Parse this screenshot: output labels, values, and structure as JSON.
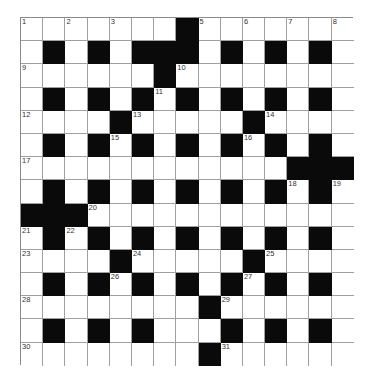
{
  "puzzle": {
    "rows": 15,
    "cols": 15,
    "colors": {
      "block": "#0a0a0a",
      "cell": "#ffffff",
      "line": "#a0a0a0",
      "number": "#333333"
    },
    "layout": [
      ".......#.......",
      ".#.#.###.#.#.#.",
      "......#........",
      ".#.#.#.#.#.#.#.",
      "....#.....#....",
      ".#.#.#.#.#.#.#.",
      "............###",
      ".#.#.#.#.#.#.#.",
      "###............",
      ".#.#.#.#.#.#.#.",
      "....#.....#....",
      ".#.#.#.#.#.#.#.",
      "........#......",
      ".#.#.#...#.#.#.",
      "........#......"
    ],
    "numbers": [
      {
        "r": 0,
        "c": 0,
        "n": "1"
      },
      {
        "r": 0,
        "c": 2,
        "n": "2"
      },
      {
        "r": 0,
        "c": 4,
        "n": "3"
      },
      {
        "r": 0,
        "c": 7,
        "n": "4"
      },
      {
        "r": 0,
        "c": 8,
        "n": "5"
      },
      {
        "r": 0,
        "c": 10,
        "n": "6"
      },
      {
        "r": 0,
        "c": 12,
        "n": "7"
      },
      {
        "r": 0,
        "c": 14,
        "n": "8"
      },
      {
        "r": 2,
        "c": 0,
        "n": "9"
      },
      {
        "r": 2,
        "c": 7,
        "n": "10"
      },
      {
        "r": 3,
        "c": 6,
        "n": "11"
      },
      {
        "r": 4,
        "c": 0,
        "n": "12"
      },
      {
        "r": 4,
        "c": 5,
        "n": "13"
      },
      {
        "r": 4,
        "c": 11,
        "n": "14"
      },
      {
        "r": 5,
        "c": 4,
        "n": "15"
      },
      {
        "r": 5,
        "c": 10,
        "n": "16"
      },
      {
        "r": 6,
        "c": 0,
        "n": "17"
      },
      {
        "r": 7,
        "c": 12,
        "n": "18"
      },
      {
        "r": 7,
        "c": 14,
        "n": "19"
      },
      {
        "r": 8,
        "c": 3,
        "n": "20"
      },
      {
        "r": 9,
        "c": 0,
        "n": "21"
      },
      {
        "r": 9,
        "c": 2,
        "n": "22"
      },
      {
        "r": 10,
        "c": 0,
        "n": "23"
      },
      {
        "r": 10,
        "c": 5,
        "n": "24"
      },
      {
        "r": 10,
        "c": 11,
        "n": "25"
      },
      {
        "r": 11,
        "c": 4,
        "n": "26"
      },
      {
        "r": 11,
        "c": 10,
        "n": "27"
      },
      {
        "r": 12,
        "c": 0,
        "n": "28"
      },
      {
        "r": 12,
        "c": 9,
        "n": "29"
      },
      {
        "r": 14,
        "c": 0,
        "n": "30"
      },
      {
        "r": 14,
        "c": 9,
        "n": "31"
      }
    ],
    "entries": []
  }
}
